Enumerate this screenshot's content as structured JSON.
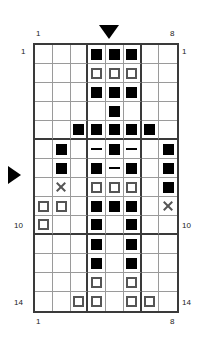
{
  "diagram": {
    "type": "pattern-grid",
    "columns": 8,
    "rows": 14,
    "heavy_column_separators": [
      3,
      6
    ],
    "heavy_row_separators": [
      5,
      10
    ],
    "colors": {
      "filled": "#000000",
      "open_outline": "#555555",
      "grid_line": "#9a9a9a",
      "border": "#3a3a3a"
    }
  },
  "labels": {
    "top_left": "1",
    "top_right": "8",
    "bottom_left": "1",
    "bottom_right": "8",
    "left_row_1": "1",
    "right_row_1": "1",
    "left_row_10": "10",
    "right_row_10": "10",
    "left_row_14": "14",
    "right_row_14": "14"
  },
  "markers": {
    "top_pointer": "triangle-down",
    "top_pointer_column": 5,
    "left_pointer": "triangle-right",
    "left_pointer_row": 8
  },
  "legend": {
    "filled": "filled-square",
    "open": "open-square",
    "dash": "dash",
    "cross": "x-mark"
  },
  "cells": [
    {
      "row": 1,
      "col": 4,
      "mark": "filled"
    },
    {
      "row": 1,
      "col": 5,
      "mark": "filled"
    },
    {
      "row": 1,
      "col": 6,
      "mark": "filled"
    },
    {
      "row": 2,
      "col": 4,
      "mark": "open"
    },
    {
      "row": 2,
      "col": 5,
      "mark": "open"
    },
    {
      "row": 2,
      "col": 6,
      "mark": "open"
    },
    {
      "row": 3,
      "col": 4,
      "mark": "filled"
    },
    {
      "row": 3,
      "col": 5,
      "mark": "filled"
    },
    {
      "row": 3,
      "col": 6,
      "mark": "filled"
    },
    {
      "row": 4,
      "col": 5,
      "mark": "filled"
    },
    {
      "row": 5,
      "col": 3,
      "mark": "filled"
    },
    {
      "row": 5,
      "col": 4,
      "mark": "filled"
    },
    {
      "row": 5,
      "col": 5,
      "mark": "filled"
    },
    {
      "row": 5,
      "col": 6,
      "mark": "filled"
    },
    {
      "row": 5,
      "col": 7,
      "mark": "filled"
    },
    {
      "row": 6,
      "col": 2,
      "mark": "filled"
    },
    {
      "row": 6,
      "col": 4,
      "mark": "dash"
    },
    {
      "row": 6,
      "col": 5,
      "mark": "filled"
    },
    {
      "row": 6,
      "col": 6,
      "mark": "dash"
    },
    {
      "row": 6,
      "col": 8,
      "mark": "filled"
    },
    {
      "row": 7,
      "col": 2,
      "mark": "filled"
    },
    {
      "row": 7,
      "col": 4,
      "mark": "filled"
    },
    {
      "row": 7,
      "col": 5,
      "mark": "dash"
    },
    {
      "row": 7,
      "col": 6,
      "mark": "filled"
    },
    {
      "row": 7,
      "col": 8,
      "mark": "filled"
    },
    {
      "row": 8,
      "col": 2,
      "mark": "cross"
    },
    {
      "row": 8,
      "col": 4,
      "mark": "open"
    },
    {
      "row": 8,
      "col": 5,
      "mark": "open"
    },
    {
      "row": 8,
      "col": 6,
      "mark": "open"
    },
    {
      "row": 8,
      "col": 8,
      "mark": "filled"
    },
    {
      "row": 9,
      "col": 1,
      "mark": "open"
    },
    {
      "row": 9,
      "col": 2,
      "mark": "open"
    },
    {
      "row": 9,
      "col": 4,
      "mark": "filled"
    },
    {
      "row": 9,
      "col": 5,
      "mark": "filled"
    },
    {
      "row": 9,
      "col": 6,
      "mark": "filled"
    },
    {
      "row": 9,
      "col": 8,
      "mark": "cross"
    },
    {
      "row": 10,
      "col": 1,
      "mark": "open"
    },
    {
      "row": 10,
      "col": 4,
      "mark": "filled"
    },
    {
      "row": 10,
      "col": 6,
      "mark": "filled"
    },
    {
      "row": 11,
      "col": 4,
      "mark": "filled"
    },
    {
      "row": 11,
      "col": 6,
      "mark": "filled"
    },
    {
      "row": 12,
      "col": 4,
      "mark": "filled"
    },
    {
      "row": 12,
      "col": 6,
      "mark": "filled"
    },
    {
      "row": 13,
      "col": 4,
      "mark": "open"
    },
    {
      "row": 13,
      "col": 6,
      "mark": "open"
    },
    {
      "row": 14,
      "col": 3,
      "mark": "open"
    },
    {
      "row": 14,
      "col": 4,
      "mark": "open"
    },
    {
      "row": 14,
      "col": 6,
      "mark": "open"
    },
    {
      "row": 14,
      "col": 7,
      "mark": "open"
    }
  ]
}
